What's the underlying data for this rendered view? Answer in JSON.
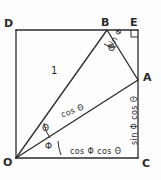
{
  "diagram": {
    "stroke_color": "#2b2b2b",
    "background_color": "#fdfdfd",
    "vertices": [
      {
        "id": "D",
        "label": "D",
        "x": 16,
        "y": 30
      },
      {
        "id": "B",
        "label": "B",
        "x": 107,
        "y": 30
      },
      {
        "id": "E",
        "label": "E",
        "x": 138,
        "y": 30
      },
      {
        "id": "A",
        "label": "A",
        "x": 138,
        "y": 80
      },
      {
        "id": "C",
        "label": "C",
        "x": 138,
        "y": 158
      },
      {
        "id": "O",
        "label": "O",
        "x": 16,
        "y": 158
      }
    ],
    "segment_labels": {
      "ob": "1",
      "ba": "sin Φ",
      "oa": "cos Θ",
      "ac": "sin Φ cos Θ",
      "oc": "cos Φ cos Θ"
    },
    "angle_labels": {
      "theta_at_o": "Θ",
      "phi_at_o": "Φ",
      "theta_at_b": "Θ"
    },
    "right_angle_marker": "right-angle-at-E"
  }
}
